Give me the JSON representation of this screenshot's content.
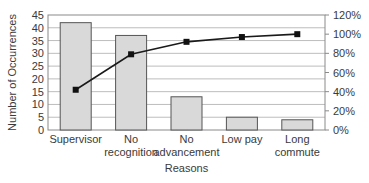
{
  "chart_data": {
    "type": "bar",
    "title": "",
    "xlabel": "Reasons",
    "ylabel": "Number of Occurrences",
    "y2label": "",
    "categories": [
      "Supervisor",
      "No recognition",
      "No advancement",
      "Low pay",
      "Long commute"
    ],
    "category_lines": [
      [
        "Supervisor"
      ],
      [
        "No",
        "recognition"
      ],
      [
        "No",
        "advancement"
      ],
      [
        "Low pay"
      ],
      [
        "Long",
        "commute"
      ]
    ],
    "series": [
      {
        "name": "Occurrences",
        "type": "bar",
        "axis": "left",
        "values": [
          42,
          37,
          13,
          5,
          4
        ]
      },
      {
        "name": "Cumulative %",
        "type": "line",
        "axis": "right",
        "values": [
          42,
          79,
          92,
          97,
          100
        ]
      }
    ],
    "ylim": [
      0,
      45
    ],
    "yticks": [
      0,
      5,
      10,
      15,
      20,
      25,
      30,
      35,
      40,
      45
    ],
    "y2lim": [
      0,
      120
    ],
    "y2ticks": [
      "0%",
      "20%",
      "40%",
      "60%",
      "80%",
      "100%",
      "120%"
    ],
    "grid": true,
    "legend": "none",
    "colors": {
      "bar_fill": "#d9d9d9",
      "bar_stroke": "#555555",
      "line": "#1a1a1a",
      "marker": "#111111",
      "grid": "#bdbdbd"
    }
  }
}
